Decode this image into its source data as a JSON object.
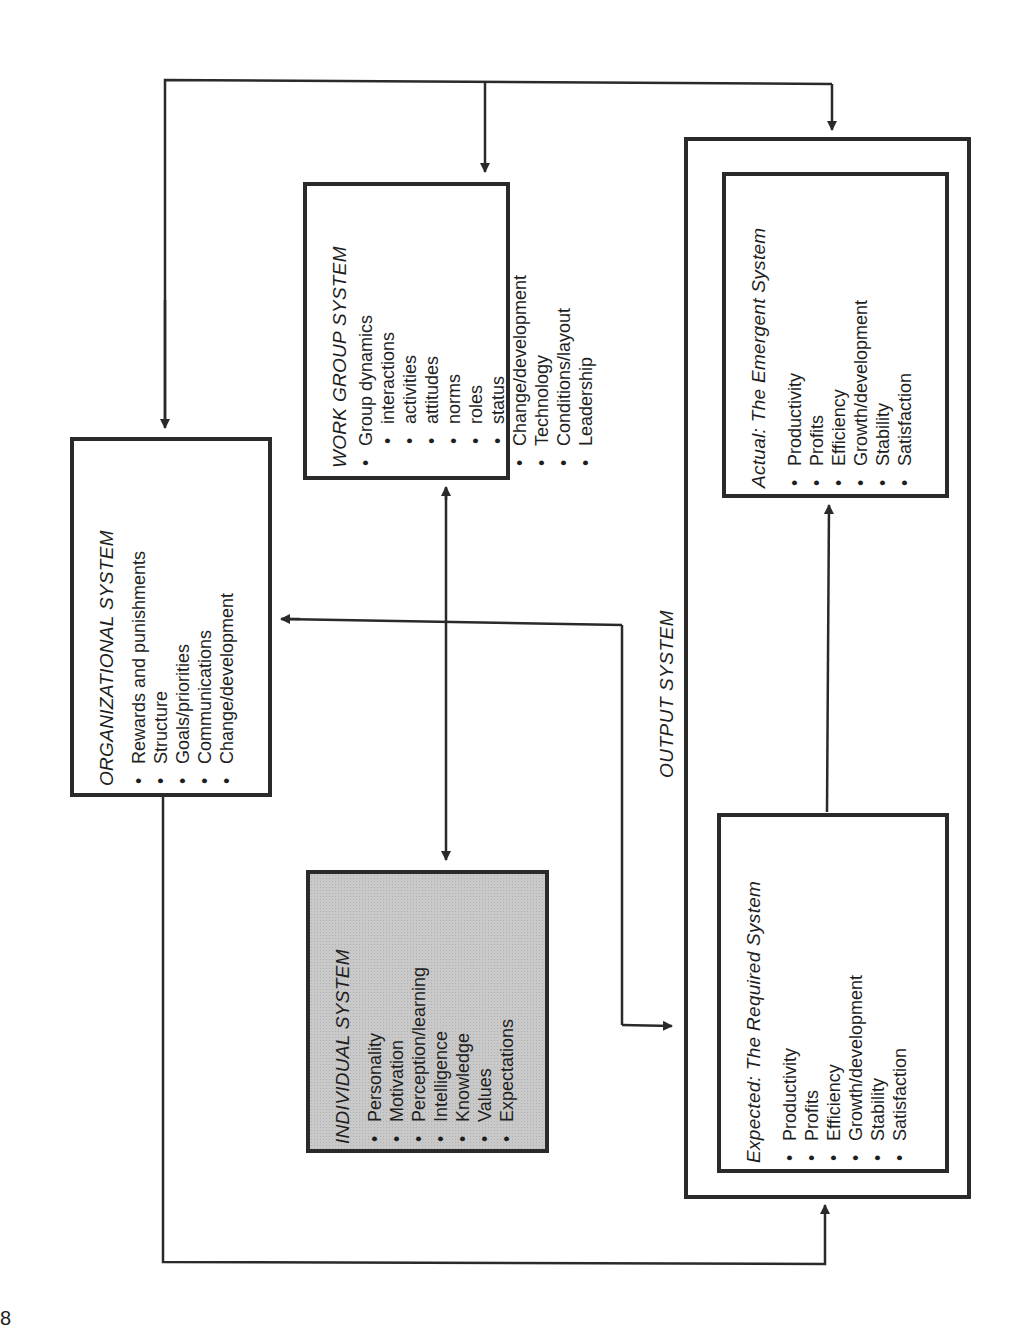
{
  "diagram": {
    "organizational": {
      "title": "ORGANIZATIONAL SYSTEM",
      "items": [
        "Rewards and punishments",
        "Structure",
        "Goals/priorities",
        "Communications",
        "Change/development"
      ]
    },
    "work_group": {
      "title": "WORK GROUP SYSTEM",
      "items": [
        {
          "label": "Group dynamics",
          "level": 0
        },
        {
          "label": "interactions",
          "level": 1
        },
        {
          "label": "activities",
          "level": 1
        },
        {
          "label": "attitudes",
          "level": 1
        },
        {
          "label": "norms",
          "level": 1
        },
        {
          "label": "roles",
          "level": 1
        },
        {
          "label": "status",
          "level": 1
        },
        {
          "label": "Change/development",
          "level": 0
        },
        {
          "label": "Technology",
          "level": 0
        },
        {
          "label": "Conditions/layout",
          "level": 0
        },
        {
          "label": "Leadership",
          "level": 0
        }
      ]
    },
    "individual": {
      "title": "INDIVIDUAL SYSTEM",
      "items": [
        "Personality",
        "Motivation",
        "Perception/learning",
        "Intelligence",
        "Knowledge",
        "Values",
        "Expectations"
      ]
    },
    "output": {
      "title": "OUTPUT SYSTEM",
      "expected": {
        "title": "Expected:   The Required System",
        "items": [
          "Productivity",
          "Profits",
          "Efficiency",
          "Growth/development",
          "Stability",
          "Satisfaction"
        ]
      },
      "actual": {
        "title": "Actual:  The Emergent System",
        "items": [
          "Productivity",
          "Profits",
          "Efficiency",
          "Growth/development",
          "Stability",
          "Satisfaction"
        ]
      }
    },
    "page_mark": "8",
    "colors": {
      "line": "#2a2a2a",
      "shade": "#c9c9c9",
      "background": "#ffffff"
    }
  }
}
